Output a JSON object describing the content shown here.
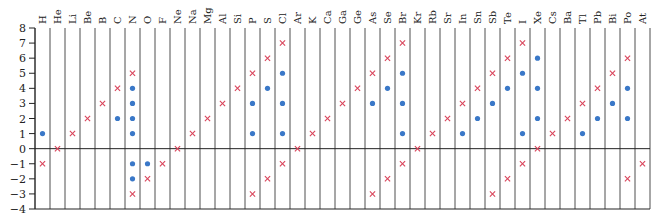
{
  "chart_data": {
    "type": "scatter",
    "title": "",
    "xlabel": "",
    "ylabel": "",
    "ylim": [
      -4,
      8
    ],
    "yticks": [
      8,
      7,
      6,
      5,
      4,
      3,
      2,
      1,
      0,
      -1,
      -2,
      -3,
      -4
    ],
    "grid": "vertical column dividers",
    "legend": "none",
    "colors": {
      "cross": "#d9435a",
      "dot": "#3a78c8",
      "axis": "#222222"
    },
    "series": [
      {
        "name": "cross-markers",
        "marker": "x",
        "color": "#d9435a"
      },
      {
        "name": "dot-markers",
        "marker": "o",
        "color": "#3a78c8"
      }
    ],
    "categories": [
      "H",
      "He",
      "Li",
      "Be",
      "B",
      "C",
      "N",
      "O",
      "F",
      "Ne",
      "Na",
      "Mg",
      "Al",
      "Si",
      "P",
      "S",
      "Cl",
      "Ar",
      "K",
      "Ca",
      "Ga",
      "Ge",
      "As",
      "Se",
      "Br",
      "Kr",
      "Rb",
      "Sr",
      "In",
      "Sn",
      "Sb",
      "Te",
      "I",
      "Xe",
      "Cs",
      "Ba",
      "Tl",
      "Pb",
      "Bi",
      "Po",
      "At"
    ],
    "points": [
      {
        "el": "H",
        "cross": [
          -1
        ],
        "dot": [
          1
        ]
      },
      {
        "el": "He",
        "cross": [
          0
        ],
        "dot": []
      },
      {
        "el": "Li",
        "cross": [
          1
        ],
        "dot": []
      },
      {
        "el": "Be",
        "cross": [
          2
        ],
        "dot": []
      },
      {
        "el": "B",
        "cross": [
          3
        ],
        "dot": []
      },
      {
        "el": "C",
        "cross": [
          4
        ],
        "dot": [
          2
        ]
      },
      {
        "el": "N",
        "cross": [
          5,
          -3
        ],
        "dot": [
          4,
          3,
          2,
          1,
          -1,
          -2
        ]
      },
      {
        "el": "O",
        "cross": [
          -2
        ],
        "dot": [
          -1
        ]
      },
      {
        "el": "F",
        "cross": [
          -1
        ],
        "dot": []
      },
      {
        "el": "Ne",
        "cross": [
          0
        ],
        "dot": []
      },
      {
        "el": "Na",
        "cross": [
          1
        ],
        "dot": []
      },
      {
        "el": "Mg",
        "cross": [
          2
        ],
        "dot": []
      },
      {
        "el": "Al",
        "cross": [
          3
        ],
        "dot": []
      },
      {
        "el": "Si",
        "cross": [
          4
        ],
        "dot": []
      },
      {
        "el": "P",
        "cross": [
          5,
          -3
        ],
        "dot": [
          3,
          1
        ]
      },
      {
        "el": "S",
        "cross": [
          6,
          -2
        ],
        "dot": [
          4
        ]
      },
      {
        "el": "Cl",
        "cross": [
          7,
          -1
        ],
        "dot": [
          5,
          3,
          1
        ]
      },
      {
        "el": "Ar",
        "cross": [
          0
        ],
        "dot": []
      },
      {
        "el": "K",
        "cross": [
          1
        ],
        "dot": []
      },
      {
        "el": "Ca",
        "cross": [
          2
        ],
        "dot": []
      },
      {
        "el": "Ga",
        "cross": [
          3
        ],
        "dot": []
      },
      {
        "el": "Ge",
        "cross": [
          4
        ],
        "dot": []
      },
      {
        "el": "As",
        "cross": [
          5,
          -3
        ],
        "dot": [
          3
        ]
      },
      {
        "el": "Se",
        "cross": [
          6,
          -2
        ],
        "dot": [
          4
        ]
      },
      {
        "el": "Br",
        "cross": [
          7,
          -1
        ],
        "dot": [
          5,
          3,
          1
        ]
      },
      {
        "el": "Kr",
        "cross": [
          0
        ],
        "dot": []
      },
      {
        "el": "Rb",
        "cross": [
          1
        ],
        "dot": []
      },
      {
        "el": "Sr",
        "cross": [
          2
        ],
        "dot": []
      },
      {
        "el": "In",
        "cross": [
          3
        ],
        "dot": [
          1
        ]
      },
      {
        "el": "Sn",
        "cross": [
          4
        ],
        "dot": [
          2
        ]
      },
      {
        "el": "Sb",
        "cross": [
          5,
          -3
        ],
        "dot": [
          3
        ]
      },
      {
        "el": "Te",
        "cross": [
          6,
          -2
        ],
        "dot": [
          4
        ]
      },
      {
        "el": "I",
        "cross": [
          7,
          -1
        ],
        "dot": [
          5,
          1
        ]
      },
      {
        "el": "Xe",
        "cross": [
          0
        ],
        "dot": [
          6,
          4,
          2
        ]
      },
      {
        "el": "Cs",
        "cross": [
          1
        ],
        "dot": []
      },
      {
        "el": "Ba",
        "cross": [
          2
        ],
        "dot": []
      },
      {
        "el": "Tl",
        "cross": [
          3
        ],
        "dot": [
          1
        ]
      },
      {
        "el": "Pb",
        "cross": [
          4
        ],
        "dot": [
          2
        ]
      },
      {
        "el": "Bi",
        "cross": [
          5
        ],
        "dot": [
          3
        ]
      },
      {
        "el": "Po",
        "cross": [
          6,
          -2
        ],
        "dot": [
          4,
          2
        ]
      },
      {
        "el": "At",
        "cross": [
          -1
        ],
        "dot": []
      }
    ]
  }
}
